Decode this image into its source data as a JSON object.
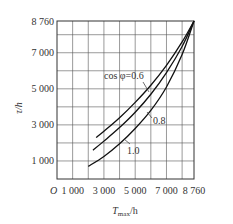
{
  "chart_data": {
    "type": "line",
    "title": "",
    "xlabel": "T_max/h",
    "ylabel": "τ/h",
    "xlim": [
      0,
      8760
    ],
    "ylim": [
      0,
      8760
    ],
    "grid": true,
    "x_ticks": [
      "O",
      "1 000",
      "3 000",
      "5 000",
      "7 000",
      "8 760"
    ],
    "y_ticks": [
      "1 000",
      "3 000",
      "5 000",
      "7 000",
      "8 760"
    ],
    "series": [
      {
        "name": "cos φ=0.6",
        "x": [
          2500,
          3000,
          4000,
          5000,
          6000,
          7000,
          8000,
          8760
        ],
        "y": [
          2300,
          2650,
          3400,
          4250,
          5200,
          6300,
          7600,
          8760
        ]
      },
      {
        "name": "0.8",
        "x": [
          2300,
          3000,
          4000,
          5000,
          6000,
          7000,
          8000,
          8760
        ],
        "y": [
          1600,
          2100,
          2850,
          3700,
          4700,
          5900,
          7350,
          8760
        ]
      },
      {
        "name": "1.0",
        "x": [
          2000,
          3000,
          4000,
          5000,
          6000,
          7000,
          8000,
          8760
        ],
        "y": [
          700,
          1250,
          1950,
          2800,
          3800,
          5100,
          6900,
          8760
        ]
      }
    ],
    "annotations": [
      "cos φ=0.6",
      "0.8",
      "1.0"
    ]
  },
  "labels": {
    "y_axis": "τ/h",
    "x_axis_main": "T",
    "x_axis_sub": "max",
    "x_axis_unit": "/h",
    "origin": "O",
    "ann_06": "cos φ=0.6",
    "ann_08": "0.8",
    "ann_10": "1.0"
  },
  "ticks": {
    "x": [
      "1 000",
      "3 000",
      "5 000",
      "7 000",
      "8 760"
    ],
    "y": [
      "1 000",
      "3 000",
      "5 000",
      "7 000",
      "8 760"
    ]
  }
}
